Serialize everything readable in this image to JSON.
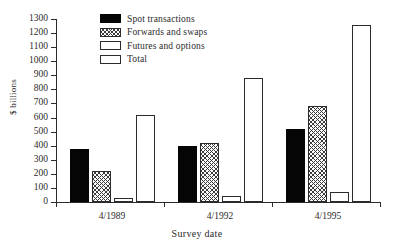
{
  "chart_data": {
    "type": "bar",
    "title": "",
    "xlabel": "Survey date",
    "ylabel": "$ billions",
    "categories": [
      "4/1989",
      "4/1992",
      "4/1995"
    ],
    "series": [
      {
        "name": "Spot transactions",
        "values": [
          380,
          400,
          520
        ],
        "fill": "solid-black"
      },
      {
        "name": "Forwards and swaps",
        "values": [
          220,
          420,
          680
        ],
        "fill": "cross-hatch"
      },
      {
        "name": "Futures and options",
        "values": [
          30,
          45,
          70
        ],
        "fill": "open-white"
      },
      {
        "name": "Total",
        "values": [
          620,
          880,
          1260
        ],
        "fill": "open-white"
      }
    ],
    "ylim": [
      0,
      1300
    ],
    "ytick_step": 100,
    "yticks": [
      0,
      100,
      200,
      300,
      400,
      500,
      600,
      700,
      800,
      900,
      1000,
      1100,
      1200,
      1300
    ],
    "ytick_labels": [
      "0",
      "100",
      "200",
      "300",
      "400",
      "500",
      "600",
      "700",
      "800",
      "900",
      "1000",
      "1100",
      "1200",
      "1300"
    ],
    "grid": false,
    "legend_position": "top-center",
    "legend_entries": [
      "Spot transactions",
      "Forwards and swaps",
      "Futures and options",
      "Total"
    ],
    "colors": {
      "spot": "#050505",
      "forwards": "#3a3a3a",
      "futures": "#ffffff",
      "total": "#ffffff",
      "axis": "#2b2b2b",
      "background": "#ffffff"
    }
  }
}
